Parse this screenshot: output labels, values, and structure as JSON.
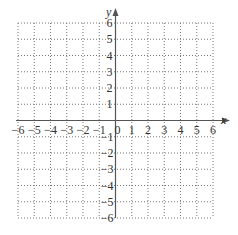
{
  "diagram": {
    "type": "coordinate-grid",
    "x_axis": {
      "label": "x",
      "min": -6,
      "max": 6,
      "ticks": [
        "-6",
        "-5",
        "-4",
        "-3",
        "-2",
        "-1",
        "0",
        "1",
        "2",
        "3",
        "4",
        "5",
        "6"
      ]
    },
    "y_axis": {
      "label": "y",
      "min": -6,
      "max": 6,
      "ticks_positive": [
        "6",
        "5",
        "4",
        "3",
        "2",
        "1"
      ],
      "ticks_negative": [
        "-1",
        "-2",
        "-3",
        "-4",
        "-5",
        "-6"
      ]
    },
    "grid": {
      "style": "dotted",
      "step": 1
    },
    "colors": {
      "axis": "#555555",
      "grid": "#777777",
      "text": "#333333"
    }
  }
}
